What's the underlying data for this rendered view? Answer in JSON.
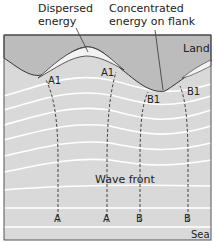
{
  "annotations": {
    "dispersed": {
      "line1": "Dispersed",
      "line2": "energy"
    },
    "concentrated": {
      "line1": "Concentrated",
      "line2": "energy on flank"
    }
  },
  "regions": {
    "land": "Land",
    "sea": "Sea"
  },
  "wave_front_label": "Wave front",
  "orthogonals": {
    "start_labels": [
      "A",
      "A",
      "B",
      "B"
    ],
    "end_labels": [
      "A1",
      "A1",
      "B1",
      "B1"
    ]
  },
  "colors": {
    "land": "#bcbcbc",
    "sea": "#d9d9d9",
    "wave_line": "#ffffff",
    "border": "#555555",
    "dispersed_strip": "#f2f2f2"
  }
}
